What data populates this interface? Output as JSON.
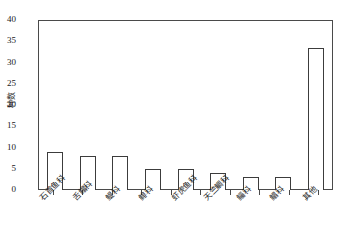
{
  "chart_data": {
    "type": "bar",
    "title": "",
    "subtitle": "",
    "xlabel": "",
    "ylabel": "种数",
    "ylim": [
      0,
      40
    ],
    "yticks": [
      0,
      5,
      10,
      15,
      20,
      25,
      30,
      35,
      40
    ],
    "grid": false,
    "legend": null,
    "categories": [
      "石首鱼科",
      "舌鳎科",
      "鳀科",
      "鲱科",
      "虾虎鱼科",
      "天竺鲷科",
      "鲻科",
      "鲳科",
      "其他"
    ],
    "values": [
      9,
      8,
      8,
      5,
      5,
      4,
      3,
      3,
      33.5
    ],
    "bar_style": {
      "fill": "#ffffff",
      "edge": "#3c3c3c"
    },
    "axis_color": "#4a4a4a",
    "frame": "box"
  }
}
